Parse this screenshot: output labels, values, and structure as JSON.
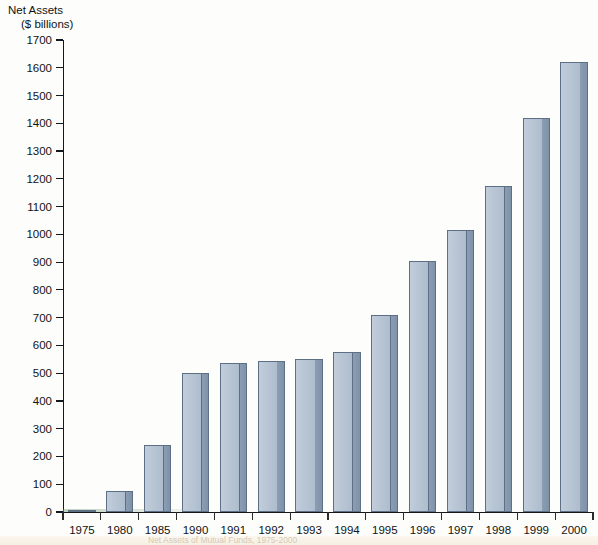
{
  "chart_data": {
    "type": "bar",
    "title": "Net Assets ($ billions)",
    "title_line1": "Net Assets",
    "title_line2": "($ billions)",
    "xlabel": "",
    "ylabel": "Net Assets ($ billions)",
    "ylim": [
      0,
      1700
    ],
    "ytick_step": 100,
    "grid": false,
    "legend": "none",
    "categories": [
      "1975",
      "1980",
      "1985",
      "1990",
      "1991",
      "1992",
      "1993",
      "1994",
      "1995",
      "1996",
      "1997",
      "1998",
      "1999",
      "2000"
    ],
    "values": [
      5,
      75,
      240,
      500,
      535,
      545,
      550,
      575,
      710,
      905,
      1015,
      1175,
      1420,
      1620
    ],
    "yticks": [
      "1700",
      "1600",
      "1500",
      "1400",
      "1300",
      "1200",
      "1100",
      "1000",
      "900",
      "800",
      "700",
      "600",
      "500",
      "400",
      "300",
      "200",
      "100",
      "0"
    ],
    "ytick_values": [
      1700,
      1600,
      1500,
      1400,
      1300,
      1200,
      1100,
      1000,
      900,
      800,
      700,
      600,
      500,
      400,
      300,
      200,
      100,
      0
    ],
    "series_name": "Net Assets",
    "colors": {
      "bar_face": "#bcc9d8",
      "bar_side": "#8596ab",
      "bar_outline": "#5d6f85",
      "axis": "#15181b",
      "text": "#111315",
      "background": "#fdfdfb"
    }
  },
  "caption": {
    "text": "Net Assets of Mutual Funds, 1975-2000"
  }
}
